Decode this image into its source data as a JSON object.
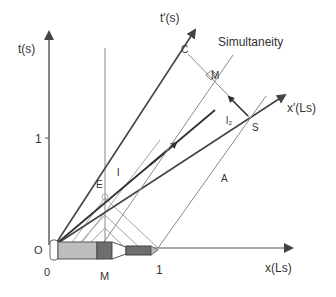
{
  "diagram": {
    "type": "spacetime (Minkowski) diagram",
    "axes": {
      "t_label": "t(s)",
      "x_label": "x(Ls)",
      "t_prime_label": "t′(s)",
      "x_prime_label": "x′(Ls)",
      "t_tick": "1",
      "x_tick": "1",
      "origin_t": "O",
      "origin_x": "0",
      "x_mid": "M"
    },
    "points": {
      "C": "C",
      "M_upper": "M",
      "S": "S",
      "E": "E",
      "A": "A"
    },
    "line_labels": {
      "l": "l",
      "l2": "l₂",
      "simultaneity": "Simultaneity"
    },
    "colors": {
      "axis": "#555555",
      "primed_axis": "#444444",
      "thin": "#9a9a9a",
      "dark": "#333333",
      "train_light": "#bdbdbd",
      "train_dark": "#6e6e6e"
    }
  }
}
